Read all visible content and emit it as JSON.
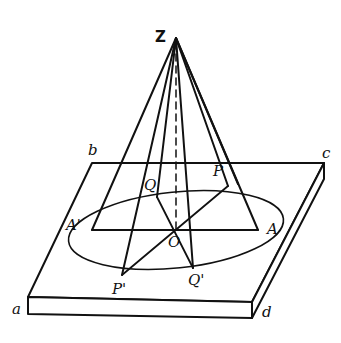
{
  "diagram": {
    "type": "geometric-figure",
    "stroke_color": "#111111",
    "background": "#ffffff",
    "points": {
      "Z": {
        "label": "Z",
        "x": 176,
        "y": 38
      },
      "O": {
        "label": "O",
        "x": 176,
        "y": 230
      },
      "A": {
        "label": "A",
        "x": 258,
        "y": 230
      },
      "A_prime": {
        "label": "A'",
        "x": 92,
        "y": 230
      },
      "P": {
        "label": "P",
        "x": 228,
        "y": 186
      },
      "Q": {
        "label": "Q",
        "x": 157,
        "y": 197
      },
      "P_prime": {
        "label": "P'",
        "x": 122,
        "y": 275
      },
      "Q_prime": {
        "label": "Q'",
        "x": 193,
        "y": 268
      }
    },
    "plate_corners": {
      "a": {
        "label": "a",
        "x": 28,
        "y": 297
      },
      "b": {
        "label": "b",
        "x": 92,
        "y": 163
      },
      "c": {
        "label": "c",
        "x": 324,
        "y": 163
      },
      "d": {
        "label": "d",
        "x": 252,
        "y": 302
      }
    },
    "ellipse": {
      "cx": 176,
      "cy": 230,
      "rx": 108,
      "ry": 38,
      "rotate": -6
    },
    "labels": [
      "Z",
      "b",
      "c",
      "Q",
      "P",
      "A'",
      "O",
      "A",
      "P'",
      "Q'",
      "a",
      "d"
    ]
  }
}
